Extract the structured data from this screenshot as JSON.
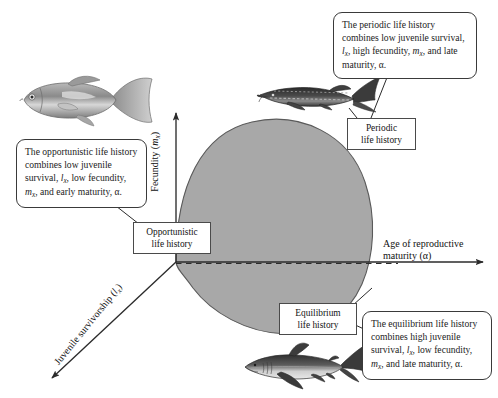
{
  "figure": {
    "background_color": "#ffffff",
    "region_fill_color": "#a8a8a8",
    "region_stroke_color": "#5a5a5a",
    "axis_color": "#2b2b2b"
  },
  "axes": {
    "y": {
      "label_prefix": "Fecundity (",
      "label_symbol": "m",
      "label_subscript": "x",
      "label_suffix": ")",
      "full_label": "Fecundity (mx)",
      "direction": "up"
    },
    "x": {
      "label_line1": "Age of reproductive",
      "label_line2": "maturity (α)",
      "full_label": "Age of reproductive maturity (α)",
      "direction": "right"
    },
    "diagonal": {
      "label_prefix": "Juvenile survivorship (",
      "label_symbol": "l",
      "label_subscript": "x",
      "label_suffix": ")",
      "full_label": "Juvenile survivorship (lx)",
      "direction": "down-left"
    }
  },
  "labels": {
    "opportunistic": {
      "line1": "Opportunistic",
      "line2": "life history"
    },
    "periodic": {
      "line1": "Periodic",
      "line2": "life history"
    },
    "equilibrium": {
      "line1": "Equilibrium",
      "line2": "life history"
    }
  },
  "callouts": {
    "periodic": {
      "seg1": "The periodic life history combines low juvenile survival, ",
      "sym1": "l",
      "sub1": "x",
      "seg2": ", high fecundity, ",
      "sym2": "m",
      "sub2": "x",
      "seg3": ", and late maturity, α.",
      "full_text": "The periodic life history combines low juvenile survival, lx, high fecundity, mx, and late maturity, α."
    },
    "opportunistic": {
      "seg1": "The opportunistic life history combines low juvenile survival, ",
      "sym1": "l",
      "sub1": "x",
      "seg2": ", low fecundity, ",
      "sym2": "m",
      "sub2": "x",
      "seg3": ", and early maturity, α.",
      "full_text": "The opportunistic life history combines low juvenile survival, lx, low fecundity, mx, and early maturity, α."
    },
    "equilibrium": {
      "seg1": "The equilibrium life history combines high juvenile survival, ",
      "sym1": "l",
      "sub1": "x",
      "seg2": ", low fecundity, ",
      "sym2": "m",
      "sub2": "x",
      "seg3": ", and late maturity, α.",
      "full_text": "The equilibrium life history combines high juvenile survival, lx, low fecundity, mx, and late maturity, α."
    }
  },
  "illustrations": {
    "opportunistic_fish": "guppy-photo",
    "periodic_fish": "sturgeon-photo",
    "equilibrium_fish": "shark-photo"
  }
}
